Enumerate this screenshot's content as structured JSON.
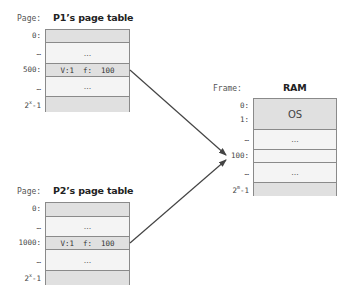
{
  "p1_table": {
    "page_label": "Page:",
    "title": "P1’s page table",
    "rows": [
      {
        "index": "0:",
        "content": "",
        "shade": "gray"
      },
      {
        "index": "…",
        "content": "…",
        "shade": "light"
      },
      {
        "index": "500:",
        "content": "V:1  f:  100",
        "shade": "gray"
      },
      {
        "index": "…",
        "content": "…",
        "shade": "light"
      },
      {
        "index_base": "2",
        "index_sup": "x",
        "index_tail": "-1",
        "content": "",
        "shade": "gray"
      }
    ]
  },
  "p2_table": {
    "page_label": "Page:",
    "title": "P2’s page table",
    "rows": [
      {
        "index": "0:",
        "content": "",
        "shade": "gray"
      },
      {
        "index": "…",
        "content": "…",
        "shade": "light"
      },
      {
        "index": "1000:",
        "content": "V:1  f:  100",
        "shade": "gray"
      },
      {
        "index": "…",
        "content": "…",
        "shade": "light"
      },
      {
        "index_base": "2",
        "index_sup": "x",
        "index_tail": "-1",
        "content": "",
        "shade": "gray"
      }
    ]
  },
  "ram": {
    "frame_label": "Frame:",
    "title": "RAM",
    "os_label": "OS",
    "indices": {
      "f0": "0:",
      "f1": "1:",
      "dots1": "…",
      "f100": "100:",
      "dots2": "…",
      "last_base": "2",
      "last_sup": "m",
      "last_tail": "-1"
    },
    "rows": [
      {
        "content": "OS",
        "shade": "gray"
      },
      {
        "content": "…",
        "shade": "light"
      },
      {
        "content": "",
        "shade": "light"
      },
      {
        "content": "…",
        "shade": "light"
      },
      {
        "content": "",
        "shade": "gray"
      }
    ]
  },
  "arrows": [
    {
      "from": "P1 page 500",
      "to": "RAM frame 100"
    },
    {
      "from": "P2 page 1000",
      "to": "RAM frame 100"
    }
  ],
  "colors": {
    "gray_row": "#e0e0e0",
    "light_row": "#f4f4f4",
    "border": "#8a8a8a",
    "arrow": "#444444"
  }
}
